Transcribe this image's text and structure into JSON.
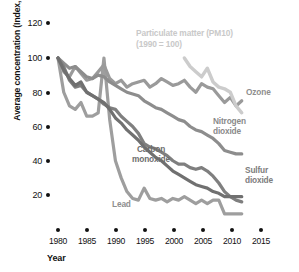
{
  "axes": {
    "ylabel": "Average concentration (Index, 1980 = 100)",
    "xlabel": "Year",
    "yticks": [
      "120",
      "100",
      "80",
      "60",
      "40",
      "20"
    ],
    "xticks": [
      "1980",
      "1985",
      "1990",
      "1995",
      "2000",
      "2005",
      "2010",
      "2015"
    ]
  },
  "annotations": {
    "pm10_line1": "Particulate matter (PM10)",
    "pm10_line2": "(1990 = 100)",
    "ozone": "Ozone",
    "nitrogen_dioxide_line1": "Nitrogen",
    "nitrogen_dioxide_line2": "dioxide",
    "sulfur_dioxide_line1": "Sulfur",
    "sulfur_dioxide_line2": "dioxide",
    "carbon_monoxide_line1": "Carbon",
    "carbon_monoxide_line2": "monoxide",
    "lead": "Lead"
  },
  "colors": {
    "ozone": "#9a9a9a",
    "nitrogen_dioxide": "#8d8d8d",
    "sulfur_dioxide": "#7f7f7f",
    "carbon_monoxide": "#707070",
    "lead": "#9e9e9e",
    "pm10": "#cccccc",
    "axis": "#111111",
    "background": "#ffffff"
  },
  "chart_data": {
    "type": "line",
    "title": "",
    "xlabel": "Year",
    "ylabel": "Average concentration (Index, 1980 = 100)",
    "xlim": [
      1980,
      2015
    ],
    "ylim": [
      0,
      120
    ],
    "yticks": [
      20,
      40,
      60,
      80,
      100,
      120
    ],
    "xticks": [
      1980,
      1985,
      1990,
      1995,
      2000,
      2005,
      2010,
      2015
    ],
    "grid": false,
    "legend": "inline-annotations",
    "series": [
      {
        "name": "Ozone",
        "color": "#9a9a9a",
        "x": [
          1980,
          1981,
          1982,
          1983,
          1984,
          1985,
          1986,
          1987,
          1988,
          1989,
          1990,
          1991,
          1992,
          1993,
          1994,
          1995,
          1996,
          1997,
          1998,
          1999,
          2000,
          2001,
          2002,
          2003,
          2004,
          2005,
          2006,
          2007,
          2008,
          2009,
          2010,
          2011,
          2012
        ],
        "values": [
          100,
          92,
          89,
          95,
          91,
          87,
          88,
          92,
          96,
          88,
          85,
          87,
          83,
          85,
          86,
          87,
          83,
          85,
          88,
          86,
          84,
          85,
          87,
          83,
          80,
          85,
          83,
          82,
          78,
          74,
          77,
          72,
          75
        ]
      },
      {
        "name": "Nitrogen dioxide",
        "color": "#8d8d8d",
        "x": [
          1980,
          1981,
          1982,
          1983,
          1984,
          1985,
          1986,
          1987,
          1988,
          1989,
          1990,
          1991,
          1992,
          1993,
          1994,
          1995,
          1996,
          1997,
          1998,
          1999,
          2000,
          2001,
          2002,
          2003,
          2004,
          2005,
          2006,
          2007,
          2008,
          2009,
          2010,
          2011,
          2012
        ],
        "values": [
          100,
          97,
          94,
          95,
          92,
          89,
          88,
          90,
          89,
          86,
          84,
          82,
          80,
          79,
          78,
          75,
          73,
          71,
          70,
          68,
          66,
          64,
          63,
          60,
          58,
          57,
          55,
          53,
          50,
          46,
          45,
          44,
          44
        ]
      },
      {
        "name": "Sulfur dioxide",
        "color": "#7f7f7f",
        "x": [
          1980,
          1981,
          1982,
          1983,
          1984,
          1985,
          1986,
          1987,
          1988,
          1989,
          1990,
          1991,
          1992,
          1993,
          1994,
          1995,
          1996,
          1997,
          1998,
          1999,
          2000,
          2001,
          2002,
          2003,
          2004,
          2005,
          2006,
          2007,
          2008,
          2009,
          2010,
          2011,
          2012
        ],
        "values": [
          100,
          95,
          87,
          83,
          84,
          80,
          78,
          76,
          73,
          71,
          70,
          66,
          63,
          60,
          56,
          50,
          48,
          47,
          45,
          43,
          40,
          38,
          38,
          36,
          35,
          36,
          34,
          31,
          27,
          22,
          19,
          17,
          16
        ]
      },
      {
        "name": "Carbon monoxide",
        "color": "#707070",
        "x": [
          1980,
          1981,
          1982,
          1983,
          1984,
          1985,
          1986,
          1987,
          1988,
          1989,
          1990,
          1991,
          1992,
          1993,
          1994,
          1995,
          1996,
          1997,
          1998,
          1999,
          2000,
          2001,
          2002,
          2003,
          2004,
          2005,
          2006,
          2007,
          2008,
          2009,
          2010,
          2011,
          2012
        ],
        "values": [
          100,
          93,
          88,
          84,
          86,
          80,
          78,
          76,
          74,
          70,
          65,
          62,
          58,
          55,
          52,
          48,
          45,
          42,
          40,
          37,
          34,
          32,
          30,
          28,
          26,
          25,
          24,
          22,
          21,
          19,
          19,
          19,
          19
        ]
      },
      {
        "name": "Lead",
        "color": "#9e9e9e",
        "x": [
          1980,
          1981,
          1982,
          1983,
          1984,
          1985,
          1986,
          1987,
          1988,
          1989,
          1990,
          1991,
          1992,
          1993,
          1994,
          1995,
          1996,
          1997,
          1998,
          1999,
          2000,
          2001,
          2002,
          2003,
          2004,
          2005,
          2006,
          2007,
          2008,
          2009,
          2010,
          2011,
          2012
        ],
        "values": [
          100,
          80,
          72,
          70,
          74,
          66,
          66,
          68,
          100,
          64,
          40,
          30,
          22,
          18,
          17,
          24,
          18,
          17,
          18,
          16,
          18,
          17,
          19,
          17,
          15,
          17,
          15,
          17,
          17,
          9,
          9,
          9,
          9
        ]
      },
      {
        "name": "Particulate matter (PM10)",
        "note": "(1990 = 100)",
        "color": "#cccccc",
        "x": [
          2002,
          2003,
          2004,
          2005,
          2006,
          2007,
          2008,
          2009,
          2010,
          2011,
          2012
        ],
        "values": [
          100,
          95,
          92,
          89,
          94,
          86,
          83,
          82,
          80,
          72,
          68
        ]
      }
    ]
  }
}
